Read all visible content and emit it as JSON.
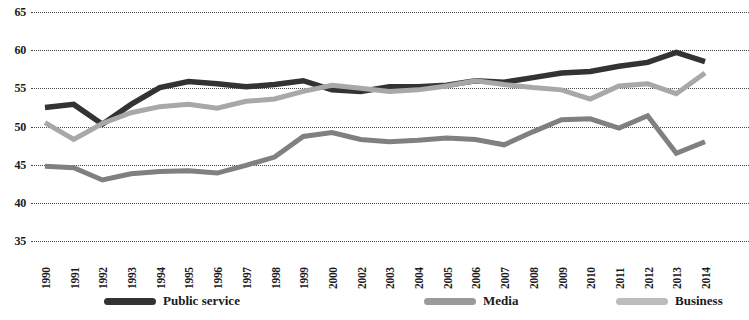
{
  "chart_data": {
    "type": "line",
    "title": "",
    "subtitle": "",
    "xlabel": "",
    "ylabel": "",
    "ylim": [
      35,
      65
    ],
    "yticks": [
      35,
      40,
      45,
      50,
      55,
      60,
      65
    ],
    "grid": true,
    "grid_style": "dotted-horizontal",
    "legend_position": "bottom",
    "categories": [
      "1990",
      "1991",
      "1992",
      "1993",
      "1994",
      "1995",
      "1996",
      "1997",
      "1998",
      "1999",
      "2000",
      "2002",
      "2003",
      "2004",
      "2005",
      "2006",
      "2007",
      "2008",
      "2009",
      "2010",
      "2011",
      "2012",
      "2013",
      "2014"
    ],
    "series": [
      {
        "name": "Public service",
        "color": "#333333",
        "values": [
          52.5,
          52.9,
          50.3,
          52.9,
          55.1,
          55.9,
          55.6,
          55.2,
          55.5,
          56.0,
          54.8,
          54.6,
          55.2,
          55.2,
          55.4,
          56.0,
          55.8,
          56.4,
          57.0,
          57.2,
          57.9,
          58.4,
          59.7,
          58.5
        ]
      },
      {
        "name": "Media",
        "color": "#a8a8a8",
        "values": [
          50.5,
          48.3,
          50.4,
          51.8,
          52.6,
          52.9,
          52.4,
          53.3,
          53.6,
          54.6,
          55.4,
          55.0,
          54.6,
          54.8,
          55.3,
          56.0,
          55.5,
          55.1,
          54.8,
          53.6,
          55.3,
          55.6,
          54.3,
          57.0
        ]
      },
      {
        "name": "Business",
        "color": "#808080",
        "values": [
          44.8,
          44.6,
          43.0,
          43.8,
          44.1,
          44.2,
          43.9,
          44.9,
          46.0,
          48.7,
          49.2,
          48.3,
          48.0,
          48.2,
          48.5,
          48.3,
          47.6,
          49.3,
          50.9,
          51.0,
          49.8,
          51.4,
          46.5,
          48.0
        ]
      }
    ]
  },
  "legend": {
    "items": [
      {
        "label": "Public service",
        "color": "#333333"
      },
      {
        "label": "Media",
        "color": "#9a9a9a"
      },
      {
        "label": "Business",
        "color": "#bcbcbc"
      }
    ]
  }
}
